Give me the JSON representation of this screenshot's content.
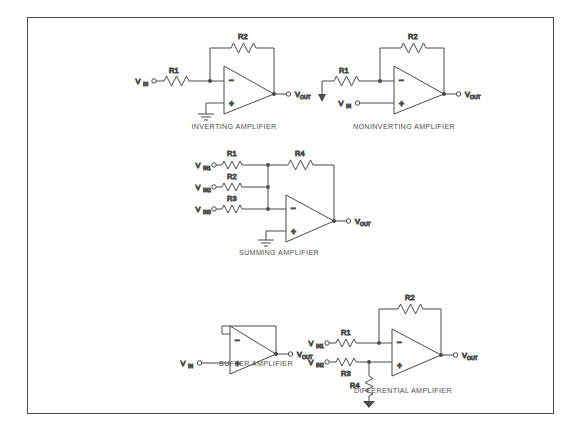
{
  "figure": {
    "type": "op-amp configuration reference diagram",
    "border_color": "#4a4a4a",
    "line_color": "#4a4a4a",
    "background": "#ffffff"
  },
  "circuits": [
    {
      "id": "inverting-amplifier",
      "caption": "INVERTING AMPLIFIER",
      "inputs": [
        {
          "name": "V",
          "sub": "IN"
        }
      ],
      "outputs": [
        {
          "name": "V",
          "sub": "OUT"
        }
      ],
      "resistors": [
        {
          "label": "R1",
          "role": "input-series",
          "orientation": "horizontal"
        },
        {
          "label": "R2",
          "role": "feedback",
          "orientation": "horizontal"
        }
      ],
      "opamp": {
        "inverting_pin": "−",
        "noninverting_pin": "+"
      },
      "grounds": 1,
      "notes": "V_IN through R1 to inverting input; R2 feedback output to inverting input; noninverting input grounded"
    },
    {
      "id": "noninverting-amplifier",
      "caption": "NONINVERTING AMPLIFIER",
      "inputs": [
        {
          "name": "V",
          "sub": "IN"
        }
      ],
      "outputs": [
        {
          "name": "V",
          "sub": "OUT"
        }
      ],
      "resistors": [
        {
          "label": "R1",
          "role": "inverting-to-ground",
          "orientation": "horizontal"
        },
        {
          "label": "R2",
          "role": "feedback",
          "orientation": "horizontal"
        }
      ],
      "opamp": {
        "inverting_pin": "−",
        "noninverting_pin": "+"
      },
      "grounds": 1,
      "notes": "V_IN to noninverting input; R1 from inverting input to ground; R2 feedback"
    },
    {
      "id": "summing-amplifier",
      "caption": "SUMMING AMPLIFIER",
      "inputs": [
        {
          "name": "V",
          "sub": "IN1"
        },
        {
          "name": "V",
          "sub": "IN2"
        },
        {
          "name": "V",
          "sub": "IN3"
        }
      ],
      "outputs": [
        {
          "name": "V",
          "sub": "OUT"
        }
      ],
      "resistors": [
        {
          "label": "R1",
          "role": "input-series",
          "orientation": "horizontal"
        },
        {
          "label": "R2",
          "role": "input-series",
          "orientation": "horizontal"
        },
        {
          "label": "R3",
          "role": "input-series",
          "orientation": "horizontal"
        },
        {
          "label": "R4",
          "role": "feedback",
          "orientation": "horizontal"
        }
      ],
      "opamp": {
        "inverting_pin": "−",
        "noninverting_pin": "+"
      },
      "grounds": 1,
      "notes": "Three inputs summed at inverting node through R1,R2,R3; R4 feedback; noninverting grounded"
    },
    {
      "id": "buffer-amplifier",
      "caption": "BUFFER AMPLIFIER",
      "inputs": [
        {
          "name": "V",
          "sub": "IN"
        }
      ],
      "outputs": [
        {
          "name": "V",
          "sub": "OUT"
        }
      ],
      "resistors": [],
      "opamp": {
        "inverting_pin": "−",
        "noninverting_pin": "+"
      },
      "grounds": 0,
      "notes": "Unity gain follower: output tied directly back to inverting input; V_IN at noninverting input"
    },
    {
      "id": "differential-amplifier",
      "caption": "DIFFERENTIAL AMPLIFIER",
      "inputs": [
        {
          "name": "V",
          "sub": "IN1"
        },
        {
          "name": "V",
          "sub": "IN2"
        }
      ],
      "outputs": [
        {
          "name": "V",
          "sub": "OUT"
        }
      ],
      "resistors": [
        {
          "label": "R1",
          "role": "inverting-input-series",
          "orientation": "horizontal"
        },
        {
          "label": "R2",
          "role": "feedback",
          "orientation": "horizontal"
        },
        {
          "label": "R3",
          "role": "noninverting-input-series",
          "orientation": "horizontal"
        },
        {
          "label": "R4",
          "role": "noninverting-to-ground",
          "orientation": "vertical"
        }
      ],
      "opamp": {
        "inverting_pin": "−",
        "noninverting_pin": "+"
      },
      "grounds": 1,
      "notes": "V_IN1 through R1 to inverting input with R2 feedback; V_IN2 through R3 to noninverting input with R4 to ground"
    }
  ]
}
